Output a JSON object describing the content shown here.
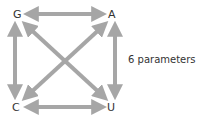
{
  "diagram": {
    "nodes": {
      "g": "G",
      "a": "A",
      "c": "C",
      "u": "U"
    },
    "edges": [
      {
        "from": "G",
        "to": "A",
        "type": "bidirectional"
      },
      {
        "from": "G",
        "to": "C",
        "type": "bidirectional"
      },
      {
        "from": "A",
        "to": "U",
        "type": "bidirectional"
      },
      {
        "from": "C",
        "to": "U",
        "type": "bidirectional"
      },
      {
        "from": "G",
        "to": "U",
        "type": "bidirectional"
      },
      {
        "from": "A",
        "to": "C",
        "type": "bidirectional"
      }
    ],
    "caption": "6 parameters",
    "arrow_color": "#a6a6a6"
  }
}
